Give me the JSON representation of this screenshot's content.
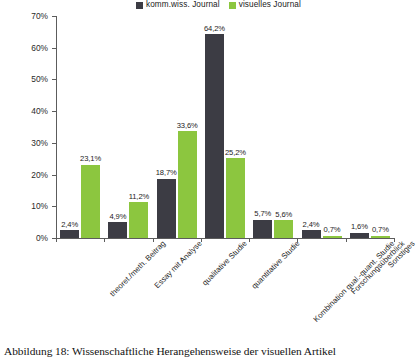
{
  "caption": "Abbildung 18: Wissenschaftliche Herangehensweise der visuellen Artikel",
  "legend": {
    "entries": [
      {
        "label": "komm.wiss. Journal",
        "color": "#3c3c44",
        "swatch_name": "legend-swatch-dark"
      },
      {
        "label": "visuelles Journal",
        "color": "#8cc63f",
        "swatch_name": "legend-swatch-green"
      }
    ]
  },
  "axis": {
    "y_ticks": [
      "0%",
      "10%",
      "20%",
      "30%",
      "40%",
      "50%",
      "60%",
      "70%"
    ]
  },
  "chart_data": {
    "type": "bar",
    "title": "",
    "subtitle": "",
    "xlabel": "",
    "ylabel": "",
    "ylim": [
      0,
      70
    ],
    "ytick_values": [
      0,
      10,
      20,
      30,
      40,
      50,
      60,
      70
    ],
    "grid": false,
    "legend_position": "top-center",
    "value_suffix": "%",
    "decimal_separator": ",",
    "categories": [
      "theoret./meth. Beitrag",
      "Essay mit Analyse",
      "qualitative Studie",
      "quantitative Studie",
      "Kombination qual.-quant. Studie",
      "Forschungsüberblick",
      "Sonstiges"
    ],
    "series": [
      {
        "name": "komm.wiss. Journal",
        "color": "#3c3c44",
        "values": [
          2.4,
          4.9,
          18.7,
          64.2,
          5.7,
          2.4,
          1.6
        ],
        "labels": [
          "2,4%",
          "4,9%",
          "18,7%",
          "64,2%",
          "5,7%",
          "2,4%",
          "1,6%"
        ]
      },
      {
        "name": "visuelles Journal",
        "color": "#8cc63f",
        "values": [
          23.1,
          11.2,
          33.6,
          25.2,
          5.6,
          0.7,
          0.7
        ],
        "labels": [
          "23,1%",
          "11,2%",
          "33,6%",
          "25,2%",
          "5,6%",
          "0,7%",
          "0,7%"
        ]
      }
    ]
  }
}
